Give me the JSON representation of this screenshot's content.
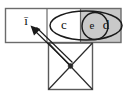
{
  "diagram": {
    "colors": {
      "shaded_cell": "#c9c9c9",
      "frame_stroke": "#6b6b6b",
      "shape_stroke": "#1a1a1a",
      "square_stroke": "#5a5a5a",
      "background": "#ffffff"
    },
    "tape": {
      "cells": [
        {
          "id": "cell-1",
          "label": "ī",
          "shaded": false
        },
        {
          "id": "cell-2",
          "label": "",
          "shaded": false
        },
        {
          "id": "cell-3",
          "label": "",
          "shaded": true
        }
      ]
    },
    "ellipses": [
      {
        "id": "ellipse-outer",
        "label": "c",
        "second_label": "d"
      },
      {
        "id": "ellipse-inner",
        "label": "e"
      }
    ],
    "labels": {
      "bar_i": "ī",
      "c": "c",
      "d": "d",
      "e": "e"
    },
    "state_box": {
      "id": "state-square",
      "has_diagonals": true,
      "center_node": "•"
    },
    "arrow": {
      "id": "pointer-arrow",
      "from": "state-square-center",
      "to": "cell-1",
      "style": "double-line"
    }
  }
}
